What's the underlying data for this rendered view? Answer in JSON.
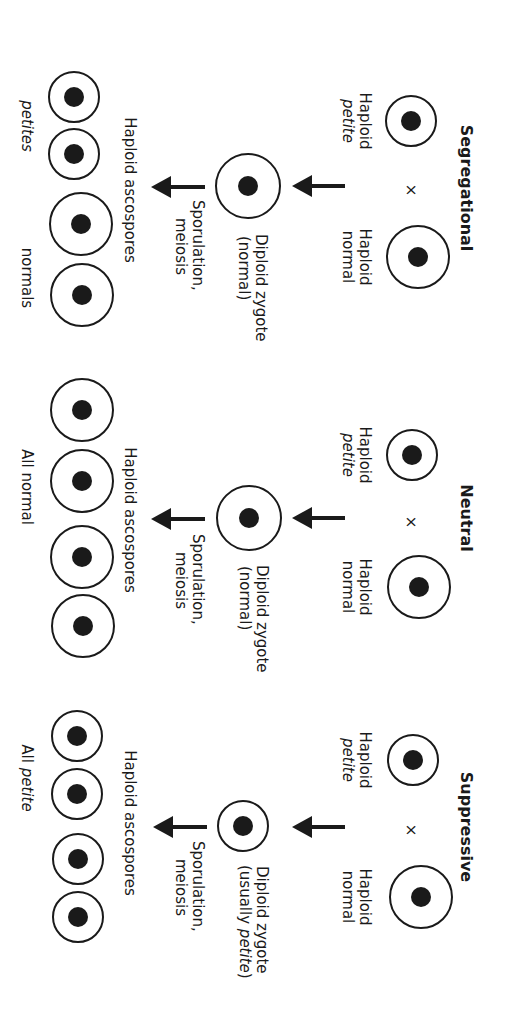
{
  "panels": [
    {
      "title": "Segregational",
      "parent_petite": {
        "line1": "Haploid",
        "line2": "petite"
      },
      "cross_symbol": "×",
      "parent_normal": {
        "line1": "Haploid",
        "line2": "normal"
      },
      "zygote": {
        "line1": "Diploid zygote",
        "line2": "(normal)"
      },
      "step": {
        "line1": "Sporulation,",
        "line2": "meiosis"
      },
      "spores_label": "Haploid ascospores",
      "result_left": "petites",
      "result_right": "normals"
    },
    {
      "title": "Neutral",
      "parent_petite": {
        "line1": "Haploid",
        "line2": "petite"
      },
      "cross_symbol": "×",
      "parent_normal": {
        "line1": "Haploid",
        "line2": "normal"
      },
      "zygote": {
        "line1": "Diploid zygote",
        "line2": "(normal)"
      },
      "step": {
        "line1": "Sporulation,",
        "line2": "meiosis"
      },
      "spores_label": "Haploid ascospores",
      "result": "All normal"
    },
    {
      "title": "Suppressive",
      "parent_petite": {
        "line1": "Haploid",
        "line2": "petite"
      },
      "cross_symbol": "×",
      "parent_normal": {
        "line1": "Haploid",
        "line2": "normal"
      },
      "zygote": {
        "line1": "Diploid zygote",
        "line2_prefix": "(usually ",
        "line2_italic": "petite",
        "line2_suffix": ")"
      },
      "step": {
        "line1": "Sporulation,",
        "line2": "meiosis"
      },
      "spores_label": "Haploid ascospores",
      "result_prefix": "All ",
      "result_italic": "petite"
    }
  ],
  "colors": {
    "stroke": "#1a1a1a",
    "nucleus": "#1a1a1a",
    "background": "#ffffff"
  }
}
